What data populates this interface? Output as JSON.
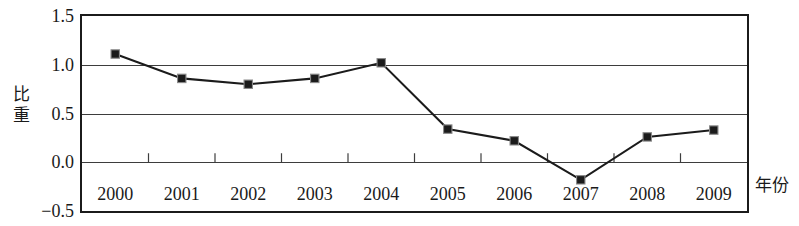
{
  "chart_data": {
    "type": "line",
    "title": "",
    "subtitle": "",
    "xlabel": "年份",
    "ylabel": "比重",
    "ylabel_chars": "比\n重",
    "categories": [
      "2000",
      "2001",
      "2002",
      "2003",
      "2004",
      "2005",
      "2006",
      "2007",
      "2008",
      "2009"
    ],
    "values": [
      1.11,
      0.86,
      0.8,
      0.86,
      1.02,
      0.34,
      0.22,
      -0.18,
      0.26,
      0.33
    ],
    "series": [
      {
        "name": "比重",
        "values": [
          1.11,
          0.86,
          0.8,
          0.86,
          1.02,
          0.34,
          0.22,
          -0.18,
          0.26,
          0.33
        ]
      }
    ],
    "ylim": [
      -0.5,
      1.5
    ],
    "ytick_labels": [
      "1.5",
      "1.0",
      "0.5",
      "0.0",
      "-0.5"
    ],
    "ytick_values": [
      1.5,
      1.0,
      0.5,
      0.0,
      -0.5
    ],
    "gridline_values": [
      1.0,
      0.5,
      0.0
    ],
    "grid": true,
    "legend": false,
    "legend_position": "none",
    "marker": "square",
    "line_color": "#1b1b1b",
    "marker_color": "#1b1b1b",
    "grid_color": "#3d3d3d",
    "frame_color": "#1b1b1b",
    "background_color": "#ffffff"
  },
  "axes": {
    "y_title": "比\n重",
    "x_title": "年份"
  }
}
